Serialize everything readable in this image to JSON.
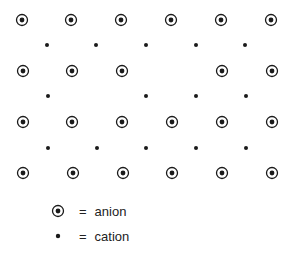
{
  "diagram": {
    "type": "ionic-crystal-lattice-with-vacancies",
    "colors": {
      "ink": "#1a1a1a",
      "background": "#ffffff"
    },
    "anion_rows": [
      {
        "y": 20,
        "x": [
          22,
          71,
          121,
          171,
          221,
          271
        ]
      },
      {
        "y": 71,
        "x": [
          23,
          72,
          122,
          222,
          272
        ],
        "vacancy_x": 172
      },
      {
        "y": 122,
        "x": [
          23,
          72,
          122,
          172,
          222,
          272
        ]
      },
      {
        "y": 173,
        "x": [
          23,
          73,
          123,
          172,
          222,
          272
        ]
      }
    ],
    "cation_rows": [
      {
        "y": 45,
        "x": [
          47,
          96,
          146,
          196,
          245
        ]
      },
      {
        "y": 96,
        "x": [
          48,
          146,
          196,
          246
        ],
        "vacancy_x": 97
      },
      {
        "y": 148,
        "x": [
          48,
          97,
          146,
          196,
          246
        ]
      }
    ]
  },
  "legend": {
    "items": [
      {
        "symbol": "anion-icon",
        "equals": "=",
        "label": "anion"
      },
      {
        "symbol": "cation-icon",
        "equals": "=",
        "label": "cation"
      }
    ]
  }
}
